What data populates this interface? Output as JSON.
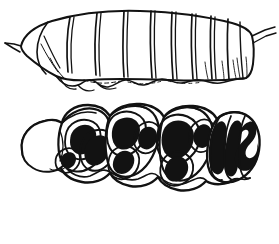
{
  "figure": {
    "medium": "black ink line drawing on white background",
    "background_color": "#ffffff",
    "ink_color": "#121212",
    "panel_count": 2,
    "caption": "",
    "labels": []
  },
  "panels": [
    {
      "id": "upper-panel",
      "name": "lateral-view-larva",
      "view": "lateral",
      "description": "Side view of an elongate segmented larva, head at left, tapering abdomen with small anal process at upper right",
      "outline_style": "open contour, unshaded",
      "segment_count": 11,
      "features": [
        "anterior projection at left margin",
        "dorsal arching contour",
        "oblique intersegmental furrows",
        "ventral lobed fold margin",
        "posterior anal process at right"
      ],
      "bounds": {
        "x": 4,
        "y": 8,
        "width": 272,
        "height": 85
      }
    },
    {
      "id": "lower-panel",
      "name": "dorsal-view-larva",
      "view": "dorsal",
      "description": "Dorsal view of the same larva showing rounded blank head capsule at left and paired solid black markings across the body segments",
      "outline_style": "closed contour with solid black maculation",
      "segment_count": 9,
      "marking_count": 17,
      "features": [
        "unmarked rounded head capsule at left",
        "paired teardrop and oval black spots",
        "white halo rings surrounding each black spot",
        "scalloped lateral margins",
        "sinuous ribbon-like markings on posterior segments"
      ],
      "bounds": {
        "x": 14,
        "y": 103,
        "width": 246,
        "height": 92
      }
    }
  ],
  "icons": {
    "specimen": "larva-icon"
  }
}
